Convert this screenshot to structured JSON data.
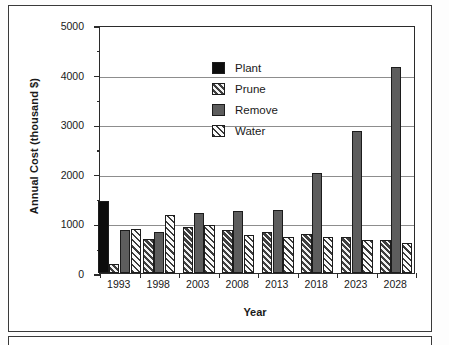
{
  "chart_data": {
    "type": "bar",
    "title": "",
    "xlabel": "Year",
    "ylabel": "Annual Cost (thousand $)",
    "categories": [
      "1993",
      "1998",
      "2003",
      "2008",
      "2013",
      "2018",
      "2023",
      "2028"
    ],
    "series": [
      {
        "name": "Plant",
        "values": [
          1460,
          0,
          0,
          0,
          0,
          0,
          0,
          0
        ]
      },
      {
        "name": "Prune",
        "values": [
          190,
          690,
          930,
          870,
          820,
          780,
          720,
          670
        ]
      },
      {
        "name": "Remove",
        "values": [
          860,
          820,
          1220,
          1250,
          1280,
          2010,
          2870,
          4160
        ]
      },
      {
        "name": "Water",
        "values": [
          890,
          1170,
          960,
          760,
          730,
          725,
          670,
          610
        ]
      }
    ],
    "ylim": [
      0,
      5000
    ],
    "ytick_labels": [
      "0",
      "1000",
      "2000",
      "3000",
      "4000",
      "5000"
    ],
    "ytick_values": [
      0,
      1000,
      2000,
      3000,
      4000,
      5000
    ],
    "yminor_values": [
      500,
      1500,
      2500,
      3500,
      4500
    ],
    "gridlines": [
      1000,
      2000,
      3000,
      4000
    ],
    "grid": true,
    "legend_position": "top-left",
    "legend": [
      "Plant",
      "Prune",
      "Remove",
      "Water"
    ],
    "series_styles": [
      "solid-black",
      "hatched-dark",
      "solid-gray",
      "hatched-light"
    ]
  },
  "colors": {
    "plant": "#0d0d0d",
    "prune": "#3f3f3f",
    "remove": "#5d5d5d",
    "water": "#fafafa",
    "axis": "#2b2b2b",
    "grid": "#8d8d8d",
    "frame": "#3a3a3a",
    "text": "#1a1a1a",
    "background": "#ffffff"
  }
}
